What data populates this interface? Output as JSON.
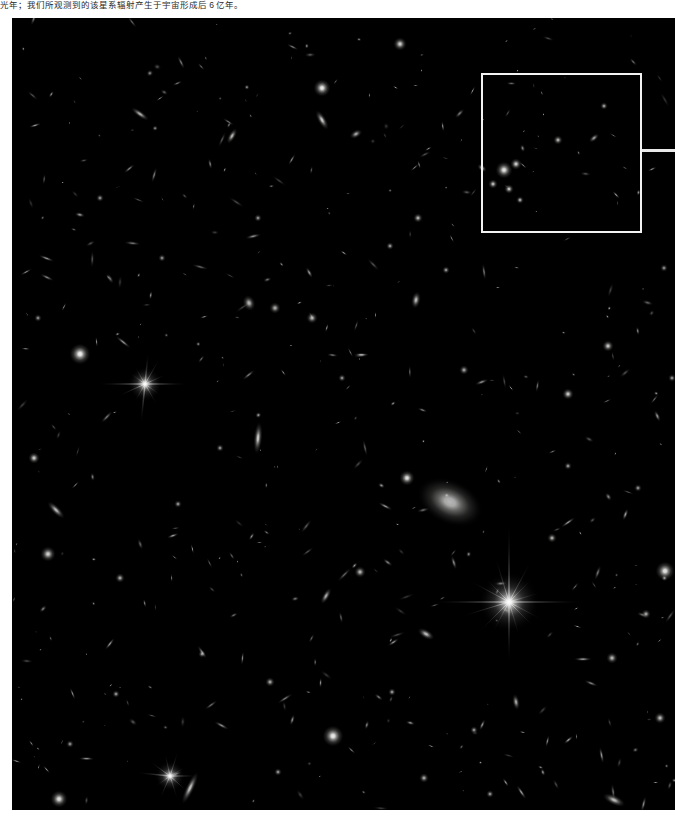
{
  "caption": {
    "text": "光年；我们所观测到的该星系辐射产生于宇宙形成后 6 亿年。",
    "color": "#2b2b2b"
  },
  "image": {
    "name": "deep-field-astronomy-photo",
    "background_color": "#000000",
    "frame": {
      "x": 12,
      "y": 18,
      "width": 663,
      "height": 792
    }
  },
  "annotations": {
    "zoom_box": {
      "label": "region-of-interest-rectangle",
      "color": "#f2f2f2",
      "border_width": 2,
      "x": 469,
      "y": 55,
      "width": 161,
      "height": 160
    },
    "leader_line": {
      "label": "callout-leader-line",
      "color": "#e9e9e9",
      "x": 630,
      "y": 131,
      "width": 33,
      "height": 3
    }
  },
  "chart_data": {
    "type": "scatter",
    "title": "",
    "xlabel": "",
    "ylabel": "",
    "xlim": [
      0,
      663
    ],
    "ylim": [
      0,
      792
    ],
    "grid": false,
    "legend": "none",
    "note": "Positions are pixel coordinates inside the black image frame. r = glow radius px, i = peak brightness 0-1, e = elongation (1 = round), a = position angle deg, spikes = number of diffraction rays.",
    "objects": [
      {
        "x": 497,
        "y": 584,
        "r": 16,
        "i": 1.0,
        "e": 1.0,
        "a": 0,
        "spikes": 16
      },
      {
        "x": 133,
        "y": 366,
        "r": 9,
        "i": 0.97,
        "e": 1.0,
        "a": 0,
        "spikes": 12
      },
      {
        "x": 158,
        "y": 758,
        "r": 8,
        "i": 0.92,
        "e": 1.0,
        "a": 0,
        "spikes": 10
      },
      {
        "x": 438,
        "y": 484,
        "r": 26,
        "i": 0.72,
        "e": 1.35,
        "a": 25,
        "spikes": 0
      },
      {
        "x": 68,
        "y": 336,
        "r": 11,
        "i": 0.95,
        "e": 1.0,
        "a": 0,
        "spikes": 0
      },
      {
        "x": 321,
        "y": 718,
        "r": 11,
        "i": 0.93,
        "e": 1.0,
        "a": 0,
        "spikes": 0
      },
      {
        "x": 653,
        "y": 553,
        "r": 10,
        "i": 0.9,
        "e": 1.0,
        "a": 0,
        "spikes": 0
      },
      {
        "x": 47,
        "y": 781,
        "r": 9,
        "i": 0.88,
        "e": 1.0,
        "a": 0,
        "spikes": 0
      },
      {
        "x": 310,
        "y": 70,
        "r": 9,
        "i": 0.93,
        "e": 1.0,
        "a": 0,
        "spikes": 0
      },
      {
        "x": 395,
        "y": 460,
        "r": 8,
        "i": 0.9,
        "e": 1.0,
        "a": 0,
        "spikes": 0
      },
      {
        "x": 388,
        "y": 26,
        "r": 7,
        "i": 0.82,
        "e": 1.0,
        "a": 0,
        "spikes": 0
      },
      {
        "x": 22,
        "y": 440,
        "r": 6,
        "i": 0.8,
        "e": 1.0,
        "a": 0,
        "spikes": 0
      },
      {
        "x": 492,
        "y": 152,
        "r": 9,
        "i": 0.9,
        "e": 1.0,
        "a": 0,
        "spikes": 0
      },
      {
        "x": 504,
        "y": 146,
        "r": 6,
        "i": 0.82,
        "e": 1.0,
        "a": 0,
        "spikes": 0
      },
      {
        "x": 481,
        "y": 166,
        "r": 5,
        "i": 0.75,
        "e": 1.0,
        "a": 0,
        "spikes": 0
      },
      {
        "x": 497,
        "y": 171,
        "r": 5,
        "i": 0.78,
        "e": 1.0,
        "a": 0,
        "spikes": 0
      },
      {
        "x": 508,
        "y": 182,
        "r": 4,
        "i": 0.7,
        "e": 1.0,
        "a": 0,
        "spikes": 0
      },
      {
        "x": 470,
        "y": 150,
        "r": 4,
        "i": 0.68,
        "e": 1.4,
        "a": 40,
        "spikes": 0
      },
      {
        "x": 556,
        "y": 376,
        "r": 6,
        "i": 0.8,
        "e": 1.0,
        "a": 0,
        "spikes": 0
      },
      {
        "x": 596,
        "y": 328,
        "r": 6,
        "i": 0.78,
        "e": 1.0,
        "a": 0,
        "spikes": 0
      },
      {
        "x": 237,
        "y": 285,
        "r": 7,
        "i": 0.72,
        "e": 1.2,
        "a": 70,
        "spikes": 0
      },
      {
        "x": 263,
        "y": 290,
        "r": 6,
        "i": 0.68,
        "e": 1.0,
        "a": 0,
        "spikes": 0
      },
      {
        "x": 300,
        "y": 300,
        "r": 6,
        "i": 0.7,
        "e": 1.0,
        "a": 0,
        "spikes": 0
      },
      {
        "x": 404,
        "y": 282,
        "r": 6,
        "i": 0.74,
        "e": 1.5,
        "a": 100,
        "spikes": 0
      },
      {
        "x": 128,
        "y": 96,
        "r": 5,
        "i": 0.7,
        "e": 2.2,
        "a": 35,
        "spikes": 0
      },
      {
        "x": 220,
        "y": 118,
        "r": 5,
        "i": 0.72,
        "e": 1.8,
        "a": 120,
        "spikes": 0
      },
      {
        "x": 310,
        "y": 102,
        "r": 6,
        "i": 0.78,
        "e": 1.9,
        "a": 60,
        "spikes": 0
      },
      {
        "x": 344,
        "y": 116,
        "r": 5,
        "i": 0.66,
        "e": 1.4,
        "a": 150,
        "spikes": 0
      },
      {
        "x": 546,
        "y": 122,
        "r": 5,
        "i": 0.7,
        "e": 1.0,
        "a": 0,
        "spikes": 0
      },
      {
        "x": 592,
        "y": 88,
        "r": 4,
        "i": 0.64,
        "e": 1.0,
        "a": 0,
        "spikes": 0
      },
      {
        "x": 582,
        "y": 120,
        "r": 4,
        "i": 0.62,
        "e": 1.6,
        "a": 140,
        "spikes": 0
      },
      {
        "x": 406,
        "y": 200,
        "r": 5,
        "i": 0.7,
        "e": 1.0,
        "a": 0,
        "spikes": 0
      },
      {
        "x": 378,
        "y": 228,
        "r": 4,
        "i": 0.62,
        "e": 1.0,
        "a": 0,
        "spikes": 0
      },
      {
        "x": 434,
        "y": 252,
        "r": 4,
        "i": 0.6,
        "e": 1.0,
        "a": 0,
        "spikes": 0
      },
      {
        "x": 246,
        "y": 420,
        "r": 7,
        "i": 0.8,
        "e": 2.4,
        "a": 95,
        "spikes": 0
      },
      {
        "x": 208,
        "y": 430,
        "r": 4,
        "i": 0.58,
        "e": 1.0,
        "a": 0,
        "spikes": 0
      },
      {
        "x": 166,
        "y": 486,
        "r": 4,
        "i": 0.6,
        "e": 1.0,
        "a": 0,
        "spikes": 0
      },
      {
        "x": 44,
        "y": 492,
        "r": 6,
        "i": 0.72,
        "e": 2.0,
        "a": 45,
        "spikes": 0
      },
      {
        "x": 36,
        "y": 536,
        "r": 8,
        "i": 0.82,
        "e": 1.0,
        "a": 0,
        "spikes": 0
      },
      {
        "x": 108,
        "y": 560,
        "r": 5,
        "i": 0.66,
        "e": 1.0,
        "a": 0,
        "spikes": 0
      },
      {
        "x": 348,
        "y": 554,
        "r": 6,
        "i": 0.72,
        "e": 1.0,
        "a": 0,
        "spikes": 0
      },
      {
        "x": 314,
        "y": 578,
        "r": 5,
        "i": 0.68,
        "e": 1.9,
        "a": 120,
        "spikes": 0
      },
      {
        "x": 414,
        "y": 616,
        "r": 6,
        "i": 0.74,
        "e": 1.6,
        "a": 30,
        "spikes": 0
      },
      {
        "x": 540,
        "y": 520,
        "r": 5,
        "i": 0.68,
        "e": 1.0,
        "a": 0,
        "spikes": 0
      },
      {
        "x": 634,
        "y": 596,
        "r": 5,
        "i": 0.66,
        "e": 1.0,
        "a": 0,
        "spikes": 0
      },
      {
        "x": 600,
        "y": 640,
        "r": 6,
        "i": 0.72,
        "e": 1.0,
        "a": 0,
        "spikes": 0
      },
      {
        "x": 648,
        "y": 700,
        "r": 6,
        "i": 0.74,
        "e": 1.0,
        "a": 0,
        "spikes": 0
      },
      {
        "x": 504,
        "y": 684,
        "r": 5,
        "i": 0.66,
        "e": 1.7,
        "a": 80,
        "spikes": 0
      },
      {
        "x": 462,
        "y": 712,
        "r": 4,
        "i": 0.6,
        "e": 1.0,
        "a": 0,
        "spikes": 0
      },
      {
        "x": 380,
        "y": 674,
        "r": 4,
        "i": 0.62,
        "e": 1.0,
        "a": 0,
        "spikes": 0
      },
      {
        "x": 258,
        "y": 664,
        "r": 5,
        "i": 0.66,
        "e": 1.0,
        "a": 0,
        "spikes": 0
      },
      {
        "x": 190,
        "y": 636,
        "r": 4,
        "i": 0.6,
        "e": 1.0,
        "a": 0,
        "spikes": 0
      },
      {
        "x": 104,
        "y": 676,
        "r": 4,
        "i": 0.6,
        "e": 1.0,
        "a": 0,
        "spikes": 0
      },
      {
        "x": 58,
        "y": 726,
        "r": 4,
        "i": 0.58,
        "e": 1.0,
        "a": 0,
        "spikes": 0
      },
      {
        "x": 178,
        "y": 770,
        "r": 7,
        "i": 0.76,
        "e": 2.6,
        "a": 115,
        "spikes": 0
      },
      {
        "x": 266,
        "y": 754,
        "r": 4,
        "i": 0.6,
        "e": 1.0,
        "a": 0,
        "spikes": 0
      },
      {
        "x": 412,
        "y": 760,
        "r": 5,
        "i": 0.66,
        "e": 1.0,
        "a": 0,
        "spikes": 0
      },
      {
        "x": 478,
        "y": 776,
        "r": 4,
        "i": 0.6,
        "e": 1.0,
        "a": 0,
        "spikes": 0
      },
      {
        "x": 602,
        "y": 782,
        "r": 7,
        "i": 0.74,
        "e": 1.8,
        "a": 25,
        "spikes": 0
      },
      {
        "x": 246,
        "y": 200,
        "r": 4,
        "i": 0.58,
        "e": 1.0,
        "a": 0,
        "spikes": 0
      },
      {
        "x": 150,
        "y": 240,
        "r": 4,
        "i": 0.56,
        "e": 1.0,
        "a": 0,
        "spikes": 0
      },
      {
        "x": 88,
        "y": 180,
        "r": 4,
        "i": 0.58,
        "e": 1.0,
        "a": 0,
        "spikes": 0
      },
      {
        "x": 26,
        "y": 300,
        "r": 4,
        "i": 0.56,
        "e": 1.0,
        "a": 0,
        "spikes": 0
      },
      {
        "x": 330,
        "y": 360,
        "r": 4,
        "i": 0.58,
        "e": 1.0,
        "a": 0,
        "spikes": 0
      },
      {
        "x": 452,
        "y": 352,
        "r": 5,
        "i": 0.64,
        "e": 1.0,
        "a": 0,
        "spikes": 0
      },
      {
        "x": 556,
        "y": 448,
        "r": 4,
        "i": 0.6,
        "e": 1.0,
        "a": 0,
        "spikes": 0
      },
      {
        "x": 626,
        "y": 470,
        "r": 4,
        "i": 0.58,
        "e": 1.0,
        "a": 0,
        "spikes": 0
      },
      {
        "x": 660,
        "y": 360,
        "r": 4,
        "i": 0.58,
        "e": 1.0,
        "a": 0,
        "spikes": 0
      },
      {
        "x": 652,
        "y": 250,
        "r": 4,
        "i": 0.56,
        "e": 1.0,
        "a": 0,
        "spikes": 0
      }
    ],
    "faint_field": {
      "count": 420,
      "seed": 20240607,
      "radius_range": [
        1.0,
        3.6
      ],
      "intensity_range": [
        0.18,
        0.62
      ],
      "elongation_range": [
        1.0,
        2.8
      ]
    }
  }
}
